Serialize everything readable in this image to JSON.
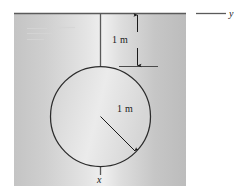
{
  "figure": {
    "type": "engineering-diagram",
    "panel": {
      "x": 14,
      "y": 13,
      "width": 172,
      "height": 173,
      "fill_left": "#c9c9c9",
      "fill_right": "#b9b9b9",
      "fill_center": "#ededed"
    },
    "axes": {
      "y_axis": {
        "label": "y",
        "orientation": "horizontal",
        "y": 13,
        "x_start": 14,
        "x_end": 226,
        "color": "#555555"
      },
      "x_axis": {
        "label": "x",
        "orientation": "vertical",
        "x": 100,
        "y_start": 13,
        "y_end": 175,
        "color": "#555555"
      }
    },
    "circle": {
      "center_x": 100,
      "center_y": 116,
      "radius_px": 50,
      "radius_label": "1 m",
      "stroke": "#2a2a2a",
      "fill": "#dcdcdc"
    },
    "dimensions": [
      {
        "name": "offset-from-y-axis",
        "label": "1 m",
        "from_y": 13,
        "to_y": 67,
        "x": 137
      },
      {
        "name": "circle-radius",
        "label": "1 m",
        "from": "center",
        "to": "circle-edge",
        "angle_deg": 45
      }
    ],
    "artifacts": {
      "description": "faint scan marks",
      "marks": [
        {
          "x": 27,
          "y": 28,
          "width": 20
        },
        {
          "x": 52,
          "y": 27,
          "width": 22
        },
        {
          "x": 27,
          "y": 33,
          "width": 25
        },
        {
          "x": 27,
          "y": 39,
          "width": 17
        }
      ]
    }
  }
}
